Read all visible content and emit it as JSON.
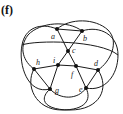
{
  "panel_label": "(f)",
  "colors": {
    "stroke": "#1a1a1a",
    "node": "#111111",
    "label": "#222222"
  },
  "nodes": [
    {
      "id": "a",
      "x": 57,
      "y": 29,
      "lx": 51,
      "ly": 39
    },
    {
      "id": "b",
      "x": 82,
      "y": 31,
      "lx": 83,
      "ly": 41
    },
    {
      "id": "c",
      "x": 68,
      "y": 51,
      "lx": 72,
      "ly": 53
    },
    {
      "id": "h",
      "x": 34,
      "y": 69,
      "lx": 36,
      "ly": 65
    },
    {
      "id": "i",
      "x": 58,
      "y": 65,
      "lx": 53,
      "ly": 63
    },
    {
      "id": "f",
      "x": 76,
      "y": 66,
      "lx": 71,
      "ly": 77
    },
    {
      "id": "d",
      "x": 98,
      "y": 70,
      "lx": 94,
      "ly": 66
    },
    {
      "id": "g",
      "x": 50,
      "y": 89,
      "lx": 55,
      "ly": 93
    },
    {
      "id": "e",
      "x": 86,
      "y": 88,
      "lx": 79,
      "ly": 92
    }
  ],
  "edges": [
    [
      "a",
      "b"
    ],
    [
      "a",
      "c"
    ],
    [
      "b",
      "c"
    ],
    [
      "c",
      "i"
    ],
    [
      "c",
      "f"
    ],
    [
      "h",
      "i"
    ],
    [
      "i",
      "f"
    ],
    [
      "f",
      "d"
    ],
    [
      "h",
      "g"
    ],
    [
      "i",
      "g"
    ],
    [
      "f",
      "e"
    ],
    [
      "d",
      "e"
    ]
  ],
  "curves": [
    "M57,29 C40,22 25,28 22,45 C18,65 28,95 50,89",
    "M82,31 C100,25 118,35 118,55 C118,75 105,92 86,88",
    "M57,29 C70,18 95,18 108,30 C120,42 110,62 98,70",
    "M82,31 C68,20 40,22 28,35 C18,48 24,62 34,69",
    "M34,69 C25,85 35,110 62,110 C85,110 92,100 86,88",
    "M98,70 C110,88 100,110 70,110 C45,110 38,100 50,89",
    "M22,45 C35,40 100,40 118,55",
    "M50,89 C60,100 78,100 86,88"
  ]
}
